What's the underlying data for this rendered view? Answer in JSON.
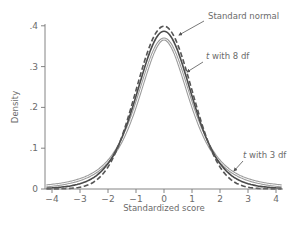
{
  "chart_data": {
    "type": "line",
    "title": "",
    "xlabel": "Standardized score",
    "ylabel": "Density",
    "xlim": [
      -4.2,
      4.2
    ],
    "ylim": [
      0,
      0.4
    ],
    "grid": false,
    "legend": "inline annotations with arrows",
    "x_ticks": [
      -4,
      -3,
      -2,
      -1,
      0,
      1,
      2,
      3,
      4
    ],
    "x_tick_labels": [
      "−4",
      "−3",
      "−2",
      "−1",
      "0",
      "1",
      "2",
      "3",
      "4"
    ],
    "y_ticks": [
      0,
      0.1,
      0.2,
      0.3,
      0.4
    ],
    "y_tick_labels": [
      "0",
      ".1",
      ".2",
      ".3",
      ".4"
    ],
    "x": [
      -4.2,
      -4.0,
      -3.75,
      -3.5,
      -3.25,
      -3.0,
      -2.75,
      -2.5,
      -2.25,
      -2.0,
      -1.75,
      -1.5,
      -1.25,
      -1.0,
      -0.75,
      -0.5,
      -0.25,
      0,
      0.25,
      0.5,
      0.75,
      1.0,
      1.25,
      1.5,
      1.75,
      2.0,
      2.25,
      2.5,
      2.75,
      3.0,
      3.25,
      3.5,
      3.75,
      4.0,
      4.2
    ],
    "series": [
      {
        "name": "Standard normal",
        "style": "dashed",
        "color": "#555555",
        "values": [
          0.0001,
          0.0001,
          0.0004,
          0.0009,
          0.002,
          0.0044,
          0.0091,
          0.0175,
          0.0317,
          0.054,
          0.0863,
          0.1295,
          0.1826,
          0.242,
          0.3011,
          0.3521,
          0.3867,
          0.3989,
          0.3867,
          0.3521,
          0.3011,
          0.242,
          0.1826,
          0.1295,
          0.0863,
          0.054,
          0.0317,
          0.0175,
          0.0091,
          0.0044,
          0.002,
          0.0009,
          0.0004,
          0.0001,
          0.0001
        ]
      },
      {
        "name": "t with 8 df",
        "style": "solid",
        "color": "#4a4a4a",
        "values": [
          0.0025,
          0.0033,
          0.0048,
          0.007,
          0.0102,
          0.015,
          0.0219,
          0.032,
          0.0461,
          0.0655,
          0.0912,
          0.1237,
          0.1625,
          0.2053,
          0.2486,
          0.2877,
          0.3174,
          0.3867,
          0.3174,
          0.2877,
          0.2486,
          0.2053,
          0.1625,
          0.1237,
          0.0912,
          0.0655,
          0.0461,
          0.032,
          0.0219,
          0.015,
          0.0102,
          0.007,
          0.0048,
          0.0033,
          0.0025
        ]
      },
      {
        "name": "t with 3 df",
        "style": "double",
        "color": "#9a9a9a",
        "values": [
          0.0065,
          0.0075,
          0.0092,
          0.0116,
          0.0147,
          0.0229,
          0.0288,
          0.0374,
          0.0498,
          0.0675,
          0.0918,
          0.1247,
          0.1667,
          0.2067,
          0.2534,
          0.2962,
          0.3335,
          0.3676,
          0.3335,
          0.2962,
          0.2534,
          0.2067,
          0.1667,
          0.1247,
          0.0918,
          0.0675,
          0.0498,
          0.0374,
          0.0288,
          0.0229,
          0.0147,
          0.0116,
          0.0092,
          0.0075,
          0.0065
        ]
      }
    ],
    "annotations": [
      {
        "text": "Standard normal",
        "italic_prefix": "",
        "x_px": 208,
        "y_px": 19,
        "arrow_from": [
          204,
          21
        ],
        "arrow_to": [
          179,
          35
        ]
      },
      {
        "text": " with 8 df",
        "italic_prefix": "t",
        "x_px": 206,
        "y_px": 59,
        "arrow_from": [
          203,
          62
        ],
        "arrow_to": [
          187,
          72
        ]
      },
      {
        "text": " with 3 df",
        "italic_prefix": "t",
        "x_px": 243,
        "y_px": 158,
        "arrow_from": [
          243,
          161
        ],
        "arrow_to": [
          234,
          171
        ]
      }
    ]
  },
  "axes": {
    "x_title": "Standardized score",
    "y_title": "Density"
  }
}
